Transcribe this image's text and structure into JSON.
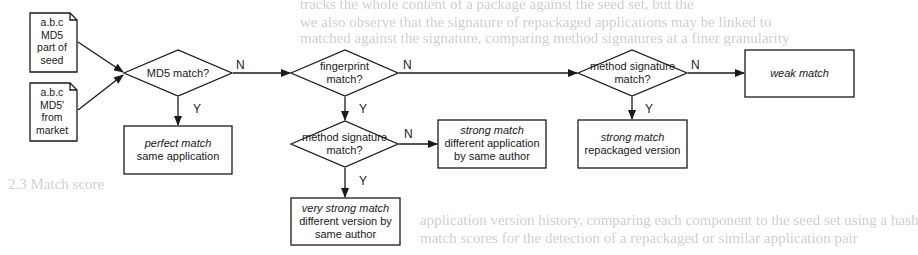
{
  "background_text": {
    "lines": [
      "tracks the whole content of a package against the seed set, but the",
      "we also observe that the signature of repackaged applications may be linked to",
      "matched against the signature, comparing method signatures at a finer granularity",
      "2.3  Match score",
      "application version history, comparing each component to the seed set using a hash",
      "match scores for the detection of a repackaged or similar application pair"
    ]
  },
  "diagram": {
    "inputs": [
      {
        "lines": [
          "a.b.c",
          "MD5",
          "part of",
          "seed"
        ]
      },
      {
        "lines": [
          "a.b.c",
          "MD5'",
          "from",
          "market"
        ]
      }
    ],
    "decisions": {
      "md5": {
        "lines": [
          "MD5 match?"
        ]
      },
      "fingerprint": {
        "lines": [
          "fingerprint",
          "match?"
        ]
      },
      "method_sig_author": {
        "lines": [
          "method signature",
          "match?"
        ]
      },
      "method_sig_market": {
        "lines": [
          "method signature",
          "match?"
        ]
      }
    },
    "outcomes": {
      "perfect": {
        "title": "perfect match",
        "detail": [
          "same application"
        ]
      },
      "strong_author": {
        "title": "strong match",
        "detail": [
          "different application",
          "by same author"
        ]
      },
      "very_strong": {
        "title": "very strong match",
        "detail": [
          "different version by",
          "same author"
        ]
      },
      "weak": {
        "title": "weak match",
        "detail": []
      },
      "strong_repackaged": {
        "title": "strong match",
        "detail": [
          "repackaged version"
        ]
      }
    },
    "edge_labels": {
      "yes": "Y",
      "no": "N"
    }
  }
}
